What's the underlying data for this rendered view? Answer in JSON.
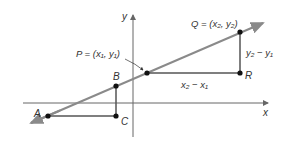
{
  "diagram": {
    "colors": {
      "line": "#8a8a8a",
      "axis": "#666666",
      "segment": "#555555",
      "point": "#111111",
      "text": "#333333"
    },
    "axes": {
      "x_label": "x",
      "y_label": "y"
    },
    "points": {
      "A": {
        "label": "A",
        "cx": 48,
        "cy": 116
      },
      "B": {
        "label": "B",
        "cx": 116,
        "cy": 86
      },
      "C": {
        "label": "C",
        "cx": 116,
        "cy": 116
      },
      "P": {
        "label": "P = (x",
        "cx": 147,
        "cy": 73
      },
      "Q": {
        "label": "Q = (x",
        "cx": 240,
        "cy": 32
      },
      "R": {
        "label": "R",
        "cx": 240,
        "cy": 73
      }
    },
    "labels": {
      "P_text": "P = (x₁, y₁)",
      "Q_text": "Q = (x₂, y₂)",
      "rise": "y₂ − y₁",
      "run": "x₂ − x₁",
      "A": "A",
      "B": "B",
      "C": "C",
      "R": "R"
    }
  }
}
